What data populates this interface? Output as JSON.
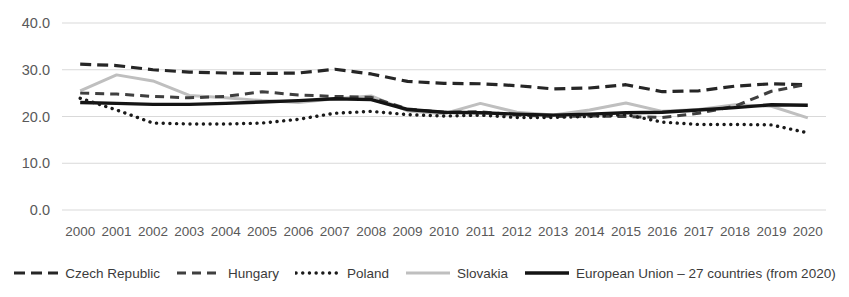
{
  "chart_data": {
    "type": "line",
    "title": "",
    "subtitle": "",
    "xlabel": "",
    "ylabel": "",
    "grid": true,
    "legend_position": "bottom",
    "ylim": [
      0.0,
      40.0
    ],
    "yticks": [
      "0.0",
      "10.0",
      "20.0",
      "30.0",
      "40.0"
    ],
    "ytick_values": [
      0.0,
      10.0,
      20.0,
      30.0,
      40.0
    ],
    "categories": [
      "2000",
      "2001",
      "2002",
      "2003",
      "2004",
      "2005",
      "2006",
      "2007",
      "2008",
      "2009",
      "2010",
      "2011",
      "2012",
      "2013",
      "2014",
      "2015",
      "2016",
      "2017",
      "2018",
      "2019",
      "2020"
    ],
    "series": [
      {
        "name": "Czech Republic",
        "style": "dashed",
        "color": "#262626",
        "width": 3.2,
        "dash": "11,6",
        "values": [
          31.2,
          30.9,
          30.0,
          29.5,
          29.3,
          29.2,
          29.3,
          30.1,
          29.1,
          27.5,
          27.1,
          27.0,
          26.6,
          25.9,
          26.1,
          26.8,
          25.3,
          25.5,
          26.5,
          27.0,
          26.8
        ]
      },
      {
        "name": "Hungary",
        "style": "dashed",
        "color": "#3f3f3f",
        "width": 3.0,
        "dash": "9,6",
        "values": [
          25.0,
          24.8,
          24.3,
          24.0,
          24.3,
          25.3,
          24.6,
          24.3,
          24.1,
          21.6,
          20.9,
          21.0,
          20.3,
          20.0,
          20.1,
          20.0,
          19.8,
          20.7,
          22.2,
          25.4,
          26.9
        ]
      },
      {
        "name": "Poland",
        "style": "dotted",
        "color": "#1a1a1a",
        "width": 3.4,
        "dash": "0.1,6.6",
        "values": [
          23.9,
          21.4,
          18.6,
          18.4,
          18.4,
          18.6,
          19.4,
          20.7,
          21.1,
          20.4,
          20.1,
          20.3,
          19.8,
          19.8,
          20.0,
          20.4,
          18.8,
          18.3,
          18.3,
          18.2,
          16.5
        ]
      },
      {
        "name": "Slovakia",
        "style": "solid",
        "color": "#bfbfbf",
        "width": 3.0,
        "dash": "",
        "values": [
          25.5,
          28.9,
          27.6,
          24.5,
          24.0,
          23.4,
          23.0,
          23.8,
          24.4,
          21.2,
          20.6,
          22.8,
          20.9,
          20.3,
          21.4,
          22.9,
          21.1,
          21.5,
          22.5,
          22.2,
          19.7
        ]
      },
      {
        "name": "European Union – 27 countries (from 2020)",
        "style": "solid",
        "color": "#141414",
        "width": 3.4,
        "dash": "",
        "values": [
          23.0,
          22.8,
          22.6,
          22.6,
          22.8,
          23.1,
          23.4,
          23.8,
          23.6,
          21.5,
          20.9,
          20.8,
          20.5,
          20.3,
          20.5,
          20.8,
          20.9,
          21.4,
          21.9,
          22.5,
          22.4
        ]
      }
    ],
    "axis_colors": {
      "gridline": "#d9d9d9",
      "tick_text": "#595959",
      "legend_text": "#3b3b3b",
      "background": "#ffffff"
    }
  },
  "legend": {
    "items": [
      {
        "label": "Czech Republic"
      },
      {
        "label": "Hungary"
      },
      {
        "label": "Poland"
      },
      {
        "label": "Slovakia"
      },
      {
        "label": "European Union – 27 countries (from 2020)"
      }
    ]
  }
}
